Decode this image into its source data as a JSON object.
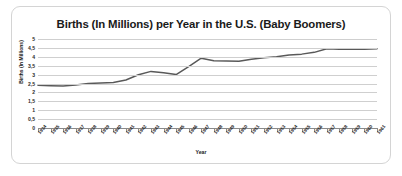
{
  "chart_data": {
    "type": "line",
    "title": "Births (In Millions) per Year in the U.S. (Baby Boomers)",
    "xlabel": "Year",
    "ylabel": "Births (In Millions)",
    "categories": [
      "1934",
      "1935",
      "1936",
      "1937",
      "1938",
      "1939",
      "1940",
      "1941",
      "1942",
      "1943",
      "1944",
      "1945",
      "1946",
      "1947",
      "1948",
      "1949",
      "1950",
      "1951",
      "1952",
      "1953",
      "1954",
      "1955",
      "1956",
      "1957",
      "1958",
      "1959",
      "1960",
      "1961"
    ],
    "x": [
      1934,
      1935,
      1936,
      1937,
      1938,
      1939,
      1940,
      1941,
      1942,
      1943,
      1944,
      1945,
      1946,
      1947,
      1948,
      1949,
      1950,
      1951,
      1952,
      1953,
      1954,
      1955,
      1956,
      1957,
      1958,
      1959,
      1960,
      1961
    ],
    "values": [
      2.4,
      2.38,
      2.36,
      2.41,
      2.5,
      2.53,
      2.56,
      2.7,
      2.99,
      3.18,
      3.1,
      3.0,
      3.45,
      3.92,
      3.78,
      3.76,
      3.75,
      3.86,
      3.95,
      4.0,
      4.1,
      4.15,
      4.25,
      4.45,
      4.43,
      4.42,
      4.43,
      4.45
    ],
    "series": [
      {
        "name": "Births (In Millions)",
        "values": [
          2.4,
          2.38,
          2.36,
          2.41,
          2.5,
          2.53,
          2.56,
          2.7,
          2.99,
          3.18,
          3.1,
          3.0,
          3.45,
          3.92,
          3.78,
          3.76,
          3.75,
          3.86,
          3.95,
          4.0,
          4.1,
          4.15,
          4.25,
          4.45,
          4.43,
          4.42,
          4.43,
          4.45
        ]
      }
    ],
    "ylim": [
      0,
      5
    ],
    "ytick_values": [
      0,
      0.5,
      1,
      1.5,
      2,
      2.5,
      3,
      3.5,
      4,
      4.5,
      5
    ],
    "ytick_labels": [
      "0",
      "0,5",
      "1",
      "1,5",
      "2",
      "2,5",
      "3",
      "3,5",
      "4",
      "4,5",
      "5"
    ],
    "grid": true,
    "legend": false,
    "line_color": "#595959",
    "grid_color": "#cfcfcf",
    "axis_color": "#8a8a8a"
  }
}
